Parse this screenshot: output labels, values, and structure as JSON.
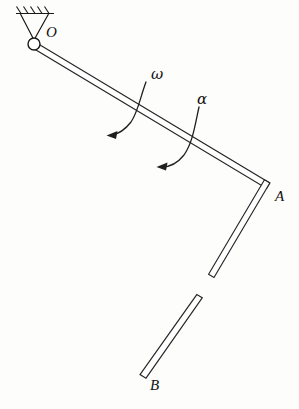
{
  "figure": {
    "type": "engineering-mechanics-diagram",
    "background_color": "#fdfdfb",
    "line_color": "#1a1a1a"
  },
  "labels": {
    "pivot": "O",
    "elbow": "A",
    "free_end": "B",
    "angular_velocity": "ω",
    "angular_acceleration": "α"
  },
  "geometry": {
    "pivot_point": {
      "x": 34,
      "y": 44,
      "radius": 6
    },
    "elbow_point": {
      "x": 268,
      "y": 186
    },
    "free_end_point": {
      "x": 143,
      "y": 375
    },
    "support_line": {
      "x1": 17,
      "y1": 13,
      "x2": 53,
      "y2": 13
    },
    "hatch_count": 5,
    "upper_bar_width": 6,
    "lower_bar_width": 6,
    "lower_bar_gap": {
      "start_y": 278,
      "end_y": 298
    }
  },
  "annotations": {
    "omega": {
      "label": "ω",
      "label_x": 152,
      "label_y": 78,
      "arc_start": {
        "x": 146,
        "y": 82
      },
      "arc_end": {
        "x": 110,
        "y": 134
      },
      "arrow_direction": "counterclockwise-left"
    },
    "alpha": {
      "label": "α",
      "label_x": 198,
      "label_y": 103,
      "arc_start": {
        "x": 199,
        "y": 107
      },
      "arc_end": {
        "x": 160,
        "y": 166
      },
      "arrow_direction": "counterclockwise-left"
    }
  }
}
